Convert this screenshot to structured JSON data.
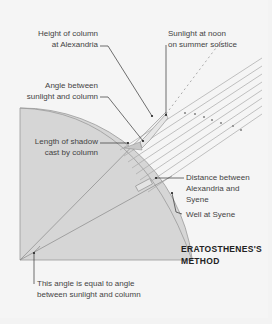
{
  "title": "ERATOSTHENES'S\nMETHOD",
  "labels": {
    "column_height": "Height of column\nat Alexandria",
    "sunlight_noon": "Sunlight at noon\non summer solstice",
    "angle_sun_column": "Angle between\nsunlight and column",
    "shadow_length": "Length of shadow\ncast by column",
    "distance": "Distance between\nAlexandria and\nSyene",
    "well": "Well at Syene",
    "angle_equal": "This angle is equal to angle\nbetween sunlight and column"
  },
  "colors": {
    "background": "#f5f5f5",
    "earth_fill": "#d6d6d6",
    "earth_stroke": "#9a9a9a",
    "ray_stroke": "#9a9a9a",
    "leader_stroke": "#333333",
    "text": "#444444"
  }
}
